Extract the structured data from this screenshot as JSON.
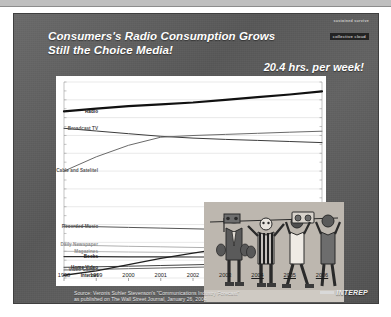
{
  "slide": {
    "headline_line1": "Consumers's Radio Consumption Grows",
    "headline_line2": "Still the Choice Media!",
    "kicker": "20.4 hrs. per week!",
    "corner_logo_line1": "sustained survive",
    "corner_logo_line2": "collective cloud",
    "brand_word": "INTEREP",
    "source_line1": "Source: Veronis Suhler Stevenson's \"Communications Industry Forecast\"",
    "source_line2": "as published on The Wall Street Journal, January 26, 2004",
    "background_color": "#5d5d5d",
    "panel_color": "#ffffff"
  },
  "illustration": {
    "name": "people-holding-radios-drawing",
    "description": "Stylized drawing of four figures holding boombox radios overhead"
  },
  "chart_data": {
    "type": "line",
    "title": "Consumers's Radio Consumption Grows Still the Choice Media!",
    "xlabel": "",
    "ylabel": "",
    "categories": [
      "1998",
      "1999",
      "2000",
      "2001",
      "2002",
      "2003",
      "2004",
      "2005",
      "2006"
    ],
    "xlim": [
      1998,
      2006
    ],
    "ylim": [
      0,
      1100
    ],
    "grid": true,
    "legend_position": "left-axis-labels",
    "annotation": "20.4 hrs. per week!",
    "series": [
      {
        "name": "Radio",
        "color": "#111111",
        "width": 2.2,
        "values": [
          935,
          950,
          965,
          975,
          985,
          1000,
          1015,
          1030,
          1048
        ]
      },
      {
        "name": "Broadcast TV",
        "color": "#3c3c3c",
        "width": 1.0,
        "values": [
          840,
          825,
          810,
          795,
          785,
          778,
          772,
          766,
          760
        ]
      },
      {
        "name": "Cable and Satelitel",
        "color": "#6a6a6a",
        "width": 1.0,
        "values": [
          600,
          680,
          745,
          790,
          800,
          806,
          812,
          818,
          824
        ]
      },
      {
        "name": "Recorded Music",
        "color": "#555555",
        "width": 1.0,
        "values": [
          290,
          288,
          284,
          280,
          276,
          272,
          270,
          268,
          266
        ]
      },
      {
        "name": "Daily Newspaper",
        "color": "#9a9a9a",
        "width": 0.8,
        "values": [
          185,
          182,
          178,
          175,
          172,
          169,
          166,
          163,
          160
        ]
      },
      {
        "name": "Magazines",
        "color": "#a6a6a6",
        "width": 0.8,
        "values": [
          150,
          148,
          146,
          144,
          142,
          140,
          139,
          138,
          137
        ]
      },
      {
        "name": "Books",
        "color": "#2e2e2e",
        "width": 1.2,
        "values": [
          120,
          120,
          119,
          119,
          118,
          118,
          117,
          117,
          116
        ]
      },
      {
        "name": "Home Video",
        "color": "#444444",
        "width": 1.0,
        "values": [
          60,
          63,
          66,
          70,
          74,
          78,
          82,
          86,
          90
        ]
      },
      {
        "name": "Video Games",
        "color": "#666666",
        "width": 1.0,
        "values": [
          45,
          48,
          52,
          56,
          60,
          64,
          68,
          72,
          76
        ]
      },
      {
        "name": "Internet",
        "color": "#1f1f1f",
        "width": 1.4,
        "values": [
          15,
          40,
          75,
          110,
          140,
          168,
          192,
          214,
          236
        ]
      }
    ]
  }
}
